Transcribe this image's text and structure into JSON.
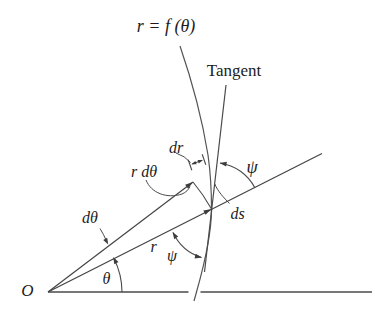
{
  "figure": {
    "type": "polar-coordinates-tangent-angle-diagram",
    "background": "#ffffff",
    "line_color": "#4a4a4a",
    "text_color": "#1c1c1c"
  },
  "labels": {
    "curve_equation": "r = f (θ)",
    "tangent": "Tangent",
    "dr": "dr",
    "r_dtheta": "r dθ",
    "ds": "ds",
    "dtheta": "dθ",
    "radius": "r",
    "theta": "θ",
    "psi_upper": "ψ",
    "psi_lower": "ψ",
    "origin": "O"
  }
}
